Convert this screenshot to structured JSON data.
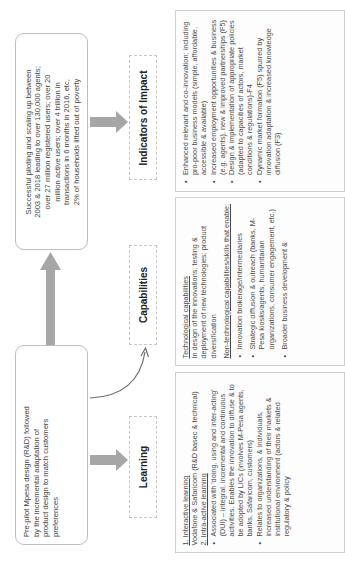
{
  "orientation": "rotated-90-ccw",
  "outcome_box": {
    "lines": [
      "Successful piloting and scaling up between",
      "2003 & 2018 leading to over 130,000 agents;",
      "over 27 million registered users; over 20",
      "million active users; over 4 trillion in",
      "transactions in 6 months in 2016, etc,",
      "2% of households lifted out of poverty"
    ]
  },
  "prepilot_box": {
    "lines": [
      "Pre-pilot Mpesa design (R&D) followed",
      "by the incremental adaptation of",
      "product design to match customers",
      "preferences"
    ]
  },
  "stages": {
    "impact": {
      "label": "Indicators of Impact"
    },
    "capabilities": {
      "label": "Capabilities"
    },
    "learning": {
      "label": "Learning"
    }
  },
  "impact_details": {
    "bullets": [
      "Enhanced relevant and co-innovation; including pro-poor business models (simple, affordable, accessible & available)",
      "Increased employment opportunities & business (e.g. agents), new & improved partnerships (F5)",
      "Design & implementation of appropriate policies (adapted to capacities of actors, market conditions & regulations)-F4",
      "Dynamic market formation (F5) spurred by innovation adaptation & increased knowledge diffusion (F3)"
    ]
  },
  "capabilities_details": {
    "tech_heading": "Technological capabilities",
    "tech_text": "In design of the innovations; testing & deployment of new technologies; product diversification",
    "nontech_heading": "Non-technological capabilities/skills that enable:",
    "bullets": [
      "Innovation brokerage/intermediaries",
      "Strategic diffusion & outreach (banks, M-Pesa kiosks/agents, humanitarian organizations, consumer engagement, etc.)",
      "Broader business development &"
    ]
  },
  "learning_details": {
    "heading1": "1. Interactive learning",
    "text1": "Vodafone & Safaricom (R&D basec & technical)",
    "heading2": "2. Intra-active learning",
    "bullets": [
      "Associated with 'doing, using and inter-acting' (DUI) – integral, incremental and continuous activities. Enables the innovation to diffuse & to be adopted by LICs (involves M-Pesa agents, banks, Safaricom, customers)",
      "Relates to organizations, & individuals, increased understanding of their markets & institutional environment (actors & related regulatory & policy"
    ]
  },
  "colors": {
    "arrow_fill": "#a6a6a6",
    "curve_stroke": "#6e6e6e",
    "box_border": "#bdbdbd"
  }
}
